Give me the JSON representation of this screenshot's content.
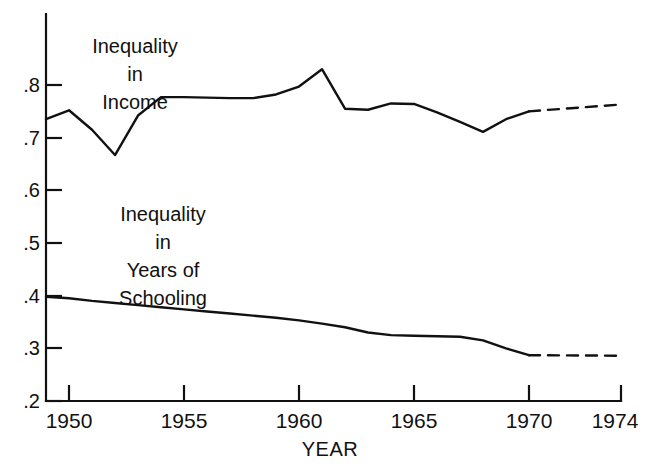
{
  "chart_data": {
    "type": "line",
    "title": "",
    "xlabel": "YEAR",
    "ylabel": "",
    "xlim": [
      1949,
      1974
    ],
    "ylim": [
      0.2,
      0.85
    ],
    "grid": false,
    "legend_position": "inline-annotations",
    "x_ticks": [
      "1950",
      "1955",
      "1960",
      "1965",
      "1970",
      "1974"
    ],
    "x_tick_values": [
      1950,
      1955,
      1960,
      1965,
      1970,
      1974
    ],
    "y_ticks": [
      ".2",
      ".3",
      ".4",
      ".5",
      ".6",
      ".7",
      ".8"
    ],
    "y_tick_values": [
      0.2,
      0.3,
      0.4,
      0.5,
      0.6,
      0.7,
      0.8
    ],
    "series": [
      {
        "name": "Inequality in Income",
        "style": "solid-then-dashed",
        "x": [
          1949,
          1950,
          1951,
          1952,
          1953,
          1954,
          1955,
          1956,
          1957,
          1958,
          1959,
          1960,
          1961,
          1962,
          1963,
          1964,
          1965,
          1966,
          1967,
          1968,
          1969,
          1970
        ],
        "values": [
          0.735,
          0.752,
          0.715,
          0.667,
          0.742,
          0.777,
          0.777,
          0.776,
          0.775,
          0.775,
          0.782,
          0.797,
          0.83,
          0.755,
          0.753,
          0.765,
          0.764,
          0.748,
          0.73,
          0.711,
          0.735,
          0.75
        ],
        "projection_x": [
          1970,
          1974
        ],
        "projection_values": [
          0.75,
          0.763
        ]
      },
      {
        "name": "Inequality in Years of Schooling",
        "style": "solid-then-dashed",
        "x": [
          1949,
          1950,
          1951,
          1952,
          1953,
          1954,
          1955,
          1956,
          1957,
          1958,
          1959,
          1960,
          1961,
          1962,
          1963,
          1964,
          1965,
          1966,
          1967,
          1968,
          1969,
          1970
        ],
        "values": [
          0.398,
          0.395,
          0.39,
          0.386,
          0.382,
          0.378,
          0.374,
          0.37,
          0.366,
          0.362,
          0.358,
          0.353,
          0.347,
          0.34,
          0.33,
          0.325,
          0.324,
          0.323,
          0.322,
          0.315,
          0.3,
          0.287
        ],
        "projection_x": [
          1970,
          1974
        ],
        "projection_values": [
          0.287,
          0.286
        ]
      }
    ],
    "annotations": [
      {
        "name": "income-label",
        "lines": [
          "Inequality",
          "in",
          "Income"
        ],
        "x": 1951.6,
        "y": 0.845
      },
      {
        "name": "schooling-label",
        "lines": [
          "Inequality",
          "in",
          "Years of",
          "Schooling"
        ],
        "x": 1952.2,
        "y": 0.565
      }
    ]
  }
}
